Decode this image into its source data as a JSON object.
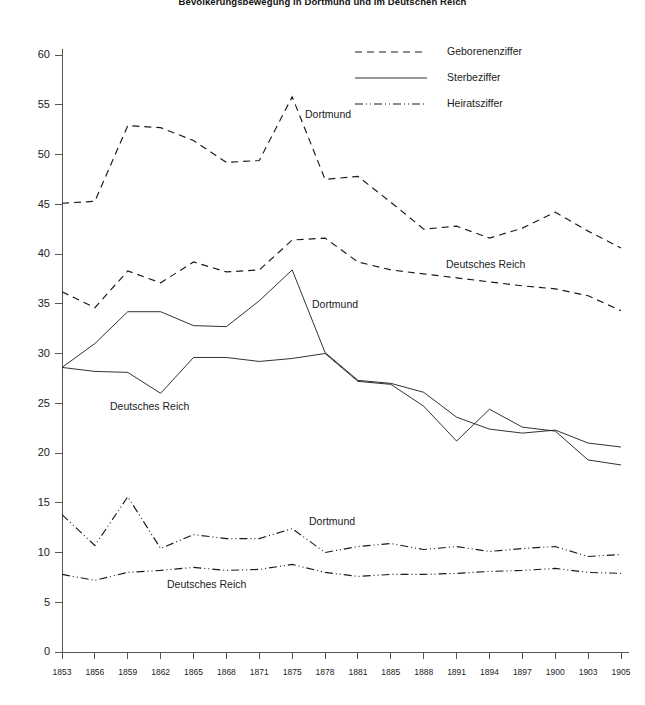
{
  "chart_data": {
    "type": "line",
    "title": "Bevölkerungsbewegung in Dortmund und im Deutschen Reich",
    "xlabel": "",
    "ylabel": "",
    "ylim": [
      0,
      60
    ],
    "ytick_step": 5,
    "grid": false,
    "legend_position": "top-right",
    "x": [
      1853,
      1856,
      1859,
      1862,
      1865,
      1868,
      1871,
      1875,
      1878,
      1881,
      1885,
      1888,
      1891,
      1894,
      1897,
      1900,
      1903,
      1905
    ],
    "ytick_labels": [
      "0",
      "5",
      "10",
      "15",
      "20",
      "25",
      "30",
      "35",
      "40",
      "45",
      "50",
      "55",
      "60"
    ],
    "xtick_labels": [
      "1853",
      "1856",
      "1859",
      "1862",
      "1865",
      "1868",
      "1871",
      "1875",
      "1878",
      "1881",
      "1885",
      "1888",
      "1891",
      "1894",
      "1897",
      "1900",
      "1903",
      "1905"
    ],
    "legend": [
      {
        "name": "Geborenenziffer",
        "style": "dashed"
      },
      {
        "name": "Sterbeziffer",
        "style": "solid"
      },
      {
        "name": "Heiratsziffer",
        "style": "dash-dot-dot"
      }
    ],
    "series": [
      {
        "name": "Geborenenziffer",
        "region": "Dortmund",
        "style": "dashed",
        "values": [
          45.1,
          45.3,
          52.9,
          52.7,
          51.4,
          49.2,
          49.4,
          55.8,
          47.5,
          47.8,
          45.2,
          42.5,
          42.8,
          41.6,
          42.6,
          44.2,
          42.3,
          40.6
        ]
      },
      {
        "name": "Geborenenziffer",
        "region": "Deutsches Reich",
        "style": "dashed",
        "values": [
          36.2,
          34.6,
          38.3,
          37.1,
          39.2,
          38.2,
          38.4,
          41.4,
          41.6,
          39.2,
          38.4,
          38.0,
          37.6,
          37.2,
          36.8,
          36.5,
          35.8,
          34.3
        ]
      },
      {
        "name": "Sterbeziffer",
        "region": "Dortmund",
        "style": "solid",
        "values": [
          28.6,
          31.0,
          34.2,
          34.2,
          32.8,
          32.7,
          35.3,
          38.4,
          30.1,
          27.3,
          27.0,
          26.1,
          23.6,
          22.4,
          22.0,
          22.3,
          21.0,
          20.6
        ]
      },
      {
        "name": "Sterbeziffer",
        "region": "Deutsches Reich",
        "style": "solid",
        "values": [
          28.6,
          28.2,
          28.1,
          26.0,
          29.6,
          29.6,
          29.2,
          29.5,
          30.0,
          27.2,
          26.9,
          24.7,
          21.2,
          24.4,
          22.6,
          22.2,
          19.3,
          18.8
        ]
      },
      {
        "name": "Heiratsziffer",
        "region": "Dortmund",
        "style": "dash-dot-dot",
        "values": [
          13.8,
          10.7,
          15.6,
          10.4,
          11.8,
          11.4,
          11.4,
          12.4,
          10.0,
          10.6,
          10.9,
          10.3,
          10.6,
          10.1,
          10.4,
          10.6,
          9.6,
          9.8
        ]
      },
      {
        "name": "Heiratsziffer",
        "region": "Deutsches Reich",
        "style": "dash-dot-dot",
        "values": [
          7.8,
          7.2,
          8.0,
          8.2,
          8.5,
          8.2,
          8.3,
          8.8,
          8.0,
          7.6,
          7.8,
          7.8,
          7.9,
          8.1,
          8.2,
          8.4,
          8.0,
          7.9
        ]
      }
    ],
    "annotations": [
      {
        "text": "Dortmund",
        "series": "Geborenenziffer",
        "x_px": 305,
        "y_px": 118
      },
      {
        "text": "Deutsches Reich",
        "series": "Geborenenziffer",
        "x_px": 446,
        "y_px": 268
      },
      {
        "text": "Dortmund",
        "series": "Sterbeziffer",
        "x_px": 312,
        "y_px": 308
      },
      {
        "text": "Deutsches Reich",
        "series": "Sterbeziffer",
        "x_px": 110,
        "y_px": 410
      },
      {
        "text": "Dortmund",
        "series": "Heiratsziffer",
        "x_px": 309,
        "y_px": 525
      },
      {
        "text": "Deutsches Reich",
        "series": "Heiratsziffer",
        "x_px": 167,
        "y_px": 588
      }
    ]
  }
}
